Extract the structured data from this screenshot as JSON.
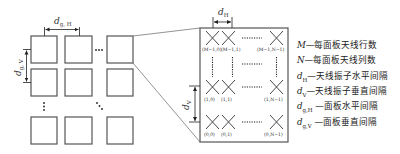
{
  "figure": {
    "left_grid": {
      "label_horizontal_spacing": "d",
      "label_horizontal_spacing_sub": "g, H",
      "label_vertical_spacing": "d",
      "label_vertical_spacing_sub": "g, V",
      "ellipsis_h": "⋯",
      "ellipsis_v": "⋮",
      "ellipsis_diag": "⋱"
    },
    "right_panel": {
      "label_dh": "d",
      "label_dh_sub": "H",
      "label_dv": "d",
      "label_dv_sub": "V",
      "element_labels": {
        "top_row": [
          "(M−1,0)",
          "(M−1,1)",
          "(M−1,N−1)"
        ],
        "middle_row": [
          "(1,0)",
          "(1,1)",
          "(1,N−1)"
        ],
        "bottom_row": [
          "(0,0)",
          "(0,1)",
          "(0,N−1)"
        ]
      },
      "dots": "⋯⋯"
    },
    "legend": [
      {
        "symbol": "M",
        "sub": "",
        "text": "—每面板天线行数"
      },
      {
        "symbol": "N",
        "sub": "",
        "text": "—每面板天线列数"
      },
      {
        "symbol": "d",
        "sub": "H",
        "text": "—天线振子水平间隔"
      },
      {
        "symbol": "d",
        "sub": "V",
        "text": "—天线振子垂直间隔"
      },
      {
        "symbol": "d",
        "sub": "g,H",
        "text": " —面板水平间隔"
      },
      {
        "symbol": "d",
        "sub": "g,V",
        "text": " —面板垂直间隔"
      }
    ]
  }
}
